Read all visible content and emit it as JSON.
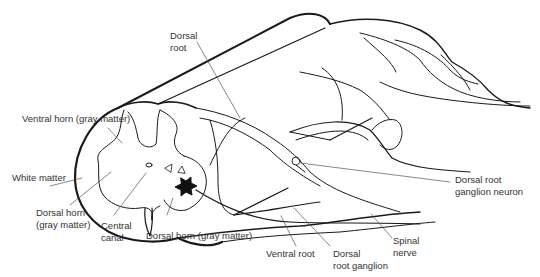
{
  "diagram": {
    "type": "anatomical-line-drawing",
    "colors": {
      "line": "#1a1a1a",
      "label_text": "#333333",
      "background": "#ffffff"
    },
    "labels": {
      "dorsal_root": {
        "line1": "Dorsal",
        "line2": "root"
      },
      "ventral_horn": {
        "line1": "Ventral horn (gray matter)"
      },
      "white_matter": {
        "line1": "White matter"
      },
      "dorsal_horn_left": {
        "line1": "Dorsal horn",
        "line2": "(gray matter)"
      },
      "central_canal": {
        "line1": "Central",
        "line2": "canal"
      },
      "dorsal_horn_center": {
        "line1": "Dorsal horn (gray matter)"
      },
      "ventral_root": {
        "line1": "Ventral root"
      },
      "dorsal_root_ganglion": {
        "line1": "Dorsal",
        "line2": "root ganglion"
      },
      "spinal_nerve": {
        "line1": "Spinal",
        "line2": "nerve"
      },
      "drg_neuron": {
        "line1": "Dorsal root",
        "line2": "ganglion neuron"
      }
    }
  }
}
